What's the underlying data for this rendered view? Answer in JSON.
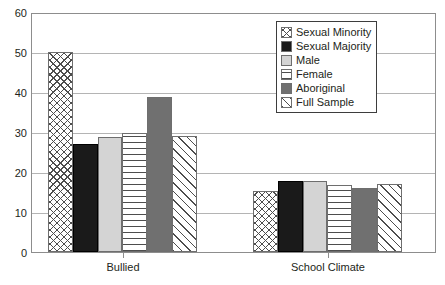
{
  "chart_data": {
    "type": "bar",
    "title": "",
    "subtitle": "",
    "xlabel": "",
    "ylabel": "",
    "ylim": [
      0,
      60
    ],
    "yticks": [
      0,
      10,
      20,
      30,
      40,
      50,
      60
    ],
    "ytick_labels": [
      "0",
      "10",
      "20",
      "30",
      "40",
      "50",
      "60"
    ],
    "grid": true,
    "legend_position": "top-right",
    "categories": [
      "Bullied",
      "School Climate"
    ],
    "series": [
      {
        "name": "Sexual Minority",
        "pattern": "crosshatch",
        "color": "#ffffff",
        "values": [
          50.5,
          15.5
        ]
      },
      {
        "name": "Sexual Majority",
        "pattern": "solid-black",
        "color": "#1a1a1a",
        "values": [
          27.3,
          17.8
        ]
      },
      {
        "name": "Male",
        "pattern": "light-gray",
        "color": "#d4d4d4",
        "values": [
          29.0,
          18.0
        ]
      },
      {
        "name": "Female",
        "pattern": "horizontal",
        "color": "#ffffff",
        "values": [
          30.0,
          16.9
        ]
      },
      {
        "name": "Aboriginal",
        "pattern": "dark-gray",
        "color": "#707070",
        "values": [
          39.0,
          16.1
        ]
      },
      {
        "name": "Full Sample",
        "pattern": "diagonal",
        "color": "#ffffff",
        "values": [
          29.3,
          17.2
        ]
      }
    ]
  },
  "legend": {
    "items": [
      {
        "label": "Sexual Minority"
      },
      {
        "label": "Sexual Majority"
      },
      {
        "label": "Male"
      },
      {
        "label": "Female"
      },
      {
        "label": "Aboriginal"
      },
      {
        "label": "Full Sample"
      }
    ]
  },
  "axes": {
    "y_tick_labels": [
      "60",
      "50",
      "40",
      "30",
      "20",
      "10",
      "0"
    ],
    "x_tick_labels": [
      "Bullied",
      "School Climate"
    ]
  }
}
